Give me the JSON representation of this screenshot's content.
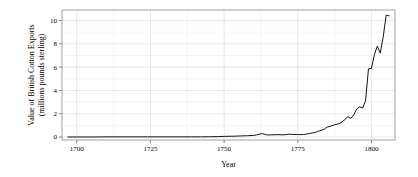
{
  "chart_data": {
    "type": "line",
    "title": "",
    "subtitle": "",
    "xlabel": "Year",
    "ylabel": "Value of British Cotton Exports\n(millions pounds sterling)",
    "ylabel_line1": "Value of British Cotton Exports",
    "ylabel_line2": "(millions pounds sterling)",
    "xlim": [
      1695,
      1808
    ],
    "ylim": [
      -0.25,
      10.9
    ],
    "xticks": [
      1700,
      1725,
      1750,
      1775,
      1800
    ],
    "xtick_labels": [
      "1700",
      "1725",
      "1750",
      "1775",
      "1800"
    ],
    "yticks": [
      0,
      2,
      4,
      6,
      8,
      10
    ],
    "ytick_labels": [
      "0",
      "2",
      "4",
      "6",
      "8",
      "10"
    ],
    "x_minor_ticks": [
      1712.5,
      1737.5,
      1762.5,
      1787.5
    ],
    "y_minor_ticks": [
      1,
      3,
      5,
      7,
      9
    ],
    "grid": true,
    "grid_color": "#d9d9d9",
    "grid_minor_color": "#ececec",
    "legend": null,
    "legend_position": "none",
    "line_color": "#141414",
    "background_color": "#ffffff",
    "series": [
      {
        "name": "Value of British Cotton Exports",
        "x": [
          1697,
          1700,
          1703,
          1706,
          1709,
          1712,
          1715,
          1718,
          1721,
          1724,
          1727,
          1730,
          1733,
          1736,
          1739,
          1742,
          1745,
          1748,
          1750,
          1752,
          1754,
          1756,
          1758,
          1760,
          1761,
          1762,
          1763,
          1764,
          1765,
          1766,
          1767,
          1768,
          1769,
          1770,
          1771,
          1772,
          1773,
          1774,
          1775,
          1776,
          1777,
          1778,
          1779,
          1780,
          1781,
          1782,
          1783,
          1784,
          1785,
          1786,
          1787,
          1788,
          1789,
          1790,
          1791,
          1792,
          1793,
          1794,
          1795,
          1796,
          1797,
          1798,
          1799,
          1800,
          1801,
          1802,
          1803,
          1804,
          1805,
          1806
        ],
        "y": [
          0.01,
          0.01,
          0.01,
          0.01,
          0.02,
          0.02,
          0.02,
          0.02,
          0.02,
          0.02,
          0.02,
          0.02,
          0.02,
          0.02,
          0.02,
          0.02,
          0.03,
          0.04,
          0.06,
          0.07,
          0.08,
          0.1,
          0.12,
          0.14,
          0.19,
          0.25,
          0.3,
          0.22,
          0.18,
          0.19,
          0.2,
          0.21,
          0.2,
          0.19,
          0.21,
          0.25,
          0.23,
          0.22,
          0.22,
          0.21,
          0.22,
          0.26,
          0.3,
          0.36,
          0.4,
          0.5,
          0.58,
          0.68,
          0.86,
          0.92,
          1.02,
          1.08,
          1.15,
          1.3,
          1.5,
          1.75,
          1.6,
          1.9,
          2.4,
          2.6,
          2.5,
          3.1,
          5.85,
          5.9,
          7.05,
          7.8,
          7.2,
          8.6,
          10.45,
          10.4
        ]
      }
    ],
    "annotations": []
  },
  "figure": {
    "width": 418,
    "height": 177
  }
}
